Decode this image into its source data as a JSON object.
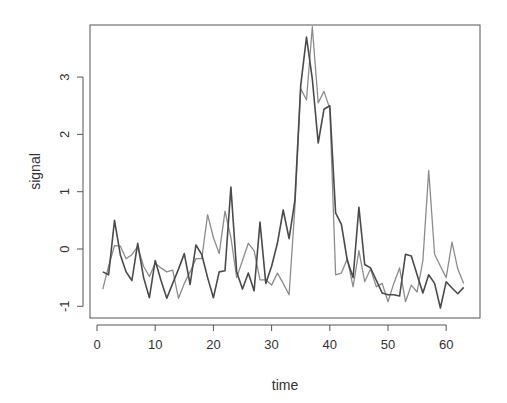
{
  "chart_data": {
    "type": "line",
    "title": "",
    "xlabel": "time",
    "ylabel": "signal",
    "xlim": [
      0,
      64
    ],
    "ylim": [
      -1.2,
      3.9
    ],
    "xticks": [
      0,
      10,
      20,
      30,
      40,
      50,
      60
    ],
    "yticks": [
      -1,
      0,
      1,
      2,
      3
    ],
    "grid": false,
    "legend": null,
    "x": [
      1,
      2,
      3,
      4,
      5,
      6,
      7,
      8,
      9,
      10,
      11,
      12,
      13,
      14,
      15,
      16,
      17,
      18,
      19,
      20,
      21,
      22,
      23,
      24,
      25,
      26,
      27,
      28,
      29,
      30,
      31,
      32,
      33,
      34,
      35,
      36,
      37,
      38,
      39,
      40,
      41,
      42,
      43,
      44,
      45,
      46,
      47,
      48,
      49,
      50,
      51,
      52,
      53,
      54,
      55,
      56,
      57,
      58,
      59,
      60,
      61,
      62,
      63
    ],
    "series": [
      {
        "name": "series-dark",
        "color": "#4a4a4a",
        "values": [
          -0.4,
          -0.45,
          0.5,
          -0.1,
          -0.4,
          -0.55,
          0.1,
          -0.5,
          -0.85,
          -0.2,
          -0.55,
          -0.86,
          -0.6,
          -0.35,
          -0.08,
          -0.62,
          0.07,
          -0.1,
          -0.5,
          -0.85,
          -0.4,
          -0.38,
          1.08,
          -0.4,
          -0.7,
          -0.42,
          -0.73,
          0.47,
          -0.6,
          -0.3,
          0.1,
          0.68,
          0.18,
          0.85,
          2.85,
          3.7,
          2.97,
          1.85,
          2.44,
          2.5,
          0.63,
          0.43,
          -0.2,
          -0.5,
          0.73,
          -0.27,
          -0.33,
          -0.55,
          -0.77,
          -0.8,
          -0.8,
          -0.82,
          -0.09,
          -0.12,
          -0.45,
          -0.77,
          -0.45,
          -0.6,
          -1.03,
          -0.57,
          -0.68,
          -0.78,
          -0.67
        ]
      },
      {
        "name": "series-light",
        "color": "#8c8c8c",
        "values": [
          -0.7,
          -0.3,
          0.06,
          0.05,
          -0.17,
          -0.1,
          0.04,
          -0.3,
          -0.48,
          -0.25,
          -0.33,
          -0.4,
          -0.37,
          -0.86,
          -0.6,
          -0.4,
          -0.17,
          -0.17,
          0.6,
          0.2,
          -0.08,
          0.66,
          0.2,
          -0.5,
          -0.2,
          0.1,
          -0.03,
          -0.54,
          -0.54,
          -0.63,
          -0.42,
          -0.6,
          -0.8,
          0.73,
          2.8,
          2.6,
          3.88,
          2.55,
          2.75,
          2.45,
          -0.45,
          -0.42,
          -0.17,
          -0.66,
          -0.03,
          -0.57,
          -0.35,
          -0.66,
          -0.6,
          -0.92,
          -0.6,
          -0.33,
          -0.92,
          -0.63,
          -0.75,
          -0.2,
          1.37,
          -0.09,
          -0.3,
          -0.5,
          0.12,
          -0.35,
          -0.6
        ]
      }
    ]
  },
  "layout": {
    "plot_left": 90,
    "plot_top": 25,
    "plot_right": 480,
    "plot_bottom": 318,
    "x0_px": 97,
    "x_per_unit": 5.82,
    "y0_px": 249,
    "y_per_unit": 57.3
  }
}
